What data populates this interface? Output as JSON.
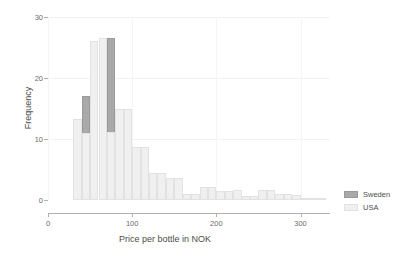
{
  "chart_data": {
    "type": "bar",
    "subtype": "histogram-overlay",
    "title": "",
    "xlabel": "Price per bottle in NOK",
    "ylabel": "Frequency",
    "xlim": [
      0,
      335
    ],
    "ylim": [
      0,
      30
    ],
    "xticks": [
      0,
      100,
      200,
      300
    ],
    "yticks": [
      0,
      10,
      20,
      30
    ],
    "grid": true,
    "legend_position": "right",
    "bin_width": 10,
    "series": [
      {
        "name": "Sweden",
        "color": "#a9a9a9",
        "bins": [
          {
            "x0": 30,
            "x1": 40,
            "value": 10.3
          },
          {
            "x0": 40,
            "x1": 50,
            "value": 17.0
          },
          {
            "x0": 50,
            "x1": 60,
            "value": 25.1
          },
          {
            "x0": 60,
            "x1": 70,
            "value": 26.6
          },
          {
            "x0": 70,
            "x1": 80,
            "value": 26.6
          },
          {
            "x0": 80,
            "x1": 90,
            "value": 9.6
          },
          {
            "x0": 90,
            "x1": 100,
            "value": 2.1
          },
          {
            "x0": 100,
            "x1": 110,
            "value": 2.1
          },
          {
            "x0": 110,
            "x1": 120,
            "value": 1.4
          },
          {
            "x0": 120,
            "x1": 130,
            "value": 0.6
          },
          {
            "x0": 130,
            "x1": 140,
            "value": 0.6
          },
          {
            "x0": 140,
            "x1": 150,
            "value": 0.6
          },
          {
            "x0": 150,
            "x1": 160,
            "value": 3.5
          }
        ]
      },
      {
        "name": "USA",
        "color": "#f0f0f0",
        "bins": [
          {
            "x0": 30,
            "x1": 40,
            "value": 13.2
          },
          {
            "x0": 40,
            "x1": 50,
            "value": 11.0
          },
          {
            "x0": 50,
            "x1": 60,
            "value": 26.0
          },
          {
            "x0": 60,
            "x1": 70,
            "value": 26.6
          },
          {
            "x0": 70,
            "x1": 80,
            "value": 11.2
          },
          {
            "x0": 80,
            "x1": 90,
            "value": 14.9
          },
          {
            "x0": 90,
            "x1": 100,
            "value": 14.9
          },
          {
            "x0": 100,
            "x1": 110,
            "value": 8.7
          },
          {
            "x0": 110,
            "x1": 120,
            "value": 8.7
          },
          {
            "x0": 120,
            "x1": 130,
            "value": 4.5
          },
          {
            "x0": 130,
            "x1": 140,
            "value": 4.5
          },
          {
            "x0": 140,
            "x1": 150,
            "value": 3.6
          },
          {
            "x0": 150,
            "x1": 160,
            "value": 3.6
          },
          {
            "x0": 160,
            "x1": 170,
            "value": 1.0
          },
          {
            "x0": 170,
            "x1": 180,
            "value": 1.0
          },
          {
            "x0": 180,
            "x1": 190,
            "value": 2.2
          },
          {
            "x0": 190,
            "x1": 200,
            "value": 2.2
          },
          {
            "x0": 200,
            "x1": 210,
            "value": 1.5
          },
          {
            "x0": 210,
            "x1": 220,
            "value": 1.5
          },
          {
            "x0": 220,
            "x1": 230,
            "value": 1.6
          },
          {
            "x0": 230,
            "x1": 240,
            "value": 0.7
          },
          {
            "x0": 240,
            "x1": 250,
            "value": 0.7
          },
          {
            "x0": 250,
            "x1": 260,
            "value": 1.6
          },
          {
            "x0": 260,
            "x1": 270,
            "value": 1.6
          },
          {
            "x0": 270,
            "x1": 280,
            "value": 1.0
          },
          {
            "x0": 280,
            "x1": 290,
            "value": 1.0
          },
          {
            "x0": 290,
            "x1": 300,
            "value": 0.9
          },
          {
            "x0": 300,
            "x1": 310,
            "value": 0.3
          },
          {
            "x0": 310,
            "x1": 320,
            "value": 0.3
          },
          {
            "x0": 320,
            "x1": 330,
            "value": 0.3
          }
        ]
      }
    ]
  },
  "legend": {
    "items": [
      {
        "label": "Sweden",
        "color": "#a9a9a9"
      },
      {
        "label": "USA",
        "color": "#f0f0f0"
      }
    ]
  }
}
